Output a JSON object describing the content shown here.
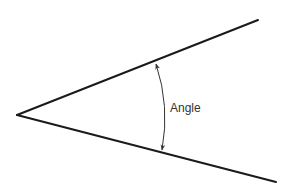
{
  "diagram": {
    "title": "Angle",
    "label": "Angle",
    "colors": {
      "background": "#ffffff",
      "ray": "#1a1a1a",
      "arc": "#333333",
      "text": "#333333"
    },
    "vertex": [
      17,
      115
    ],
    "rays": [
      {
        "name": "upper-ray",
        "end": [
          258,
          20
        ]
      },
      {
        "name": "lower-ray",
        "end": [
          276,
          182
        ]
      }
    ],
    "arc": {
      "start": [
        156,
        62
      ],
      "end": [
        162,
        151
      ],
      "arrowheads": "both"
    }
  }
}
